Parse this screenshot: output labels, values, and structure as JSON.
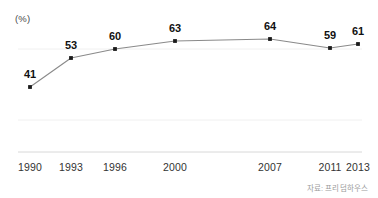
{
  "chart_data": {
    "type": "line",
    "title": "",
    "subtitle": "",
    "xlabel": "",
    "ylabel": "(%)",
    "unit_label": "(%)",
    "categories": [
      "1990",
      "1993",
      "1996",
      "2000",
      "2007",
      "2011",
      "2013"
    ],
    "values": [
      41,
      53,
      60,
      63,
      64,
      59,
      61
    ],
    "series": [
      {
        "name": "",
        "values": [
          41,
          53,
          60,
          63,
          64,
          59,
          61
        ]
      }
    ],
    "data_labels": [
      "41",
      "53",
      "60",
      "63",
      "64",
      "59",
      "61"
    ],
    "tick_labels": [
      "1990",
      "1993",
      "1996",
      "2000",
      "2007",
      "2011",
      "2013"
    ],
    "ylim": [
      0,
      70
    ],
    "grid": true,
    "legend": false,
    "legend_position": "none",
    "line_color": "#8a8a8a",
    "marker_color": "#1a1a1a",
    "axis_color": "#d8d8d8",
    "grid_color": "#f0f0f0",
    "background_color": "#ffffff",
    "points_px": [
      {
        "x": 30,
        "y": 87
      },
      {
        "x": 71,
        "y": 58
      },
      {
        "x": 115,
        "y": 49
      },
      {
        "x": 175,
        "y": 41
      },
      {
        "x": 270,
        "y": 39
      },
      {
        "x": 330,
        "y": 48
      },
      {
        "x": 358,
        "y": 44
      }
    ],
    "label_positions_px": [
      {
        "x": 30,
        "y": 80
      },
      {
        "x": 71,
        "y": 51
      },
      {
        "x": 115,
        "y": 42
      },
      {
        "x": 175,
        "y": 34
      },
      {
        "x": 270,
        "y": 32
      },
      {
        "x": 330,
        "y": 41
      },
      {
        "x": 358,
        "y": 37
      }
    ],
    "tick_positions_px": [
      30,
      71,
      115,
      175,
      270,
      330,
      358
    ],
    "axis_baseline_y_px": 152,
    "axis_start_x_px": 18,
    "axis_end_x_px": 362,
    "gridlines_y_px": [
      49,
      120
    ]
  },
  "footer": {
    "source_note": "자료: 프리덤하우스"
  }
}
